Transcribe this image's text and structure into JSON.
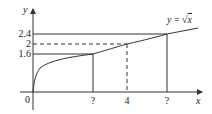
{
  "diagram": {
    "curve_label": "y = √x",
    "curve_label_parts": {
      "y": "y",
      "eq": " = ",
      "sqrt": "√",
      "x": "x"
    },
    "axes": {
      "x_label": "x",
      "y_label": "y",
      "origin_label": "0"
    },
    "y_ticks": [
      "2.4",
      "2",
      "1.6"
    ],
    "x_ticks": [
      "?",
      "4",
      "?"
    ],
    "colors": {
      "line": "#333333",
      "background": "#ffffff"
    }
  }
}
